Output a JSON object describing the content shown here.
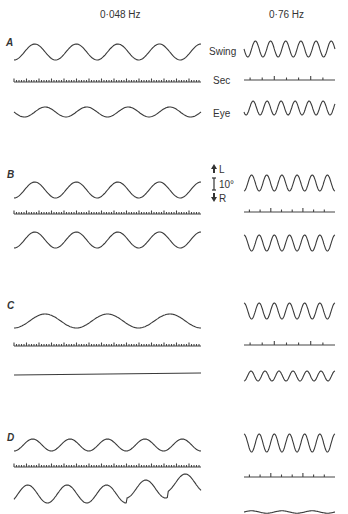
{
  "figure": {
    "column_titles": [
      "0·048 Hz",
      "0·76 Hz"
    ],
    "row_labels": [
      "Swing",
      "Sec",
      "Eye"
    ],
    "scale_bar": {
      "up": "L",
      "value": "10°",
      "down": "R"
    },
    "panels": [
      "A",
      "B",
      "C",
      "D"
    ]
  },
  "chart_data": {
    "type": "line",
    "columns": [
      {
        "frequency": "0·048 Hz"
      },
      {
        "frequency": "0·76 Hz"
      }
    ],
    "rows": [
      "Swing",
      "Sec",
      "Eye"
    ],
    "scale": {
      "label": "10°",
      "positive_direction": "L",
      "negative_direction": "R"
    },
    "panels": [
      {
        "label": "A",
        "0.048Hz": {
          "swing_cycles": 4.5,
          "swing_amp_px": 8,
          "sec_marks": "dense",
          "eye": "sinusoid",
          "eye_amp_px": 5,
          "eye_cycles": 4.5
        },
        "0.76Hz": {
          "swing_cycles": 6,
          "swing_amp_px": 8,
          "sec_marks": 7,
          "eye": "sinusoid",
          "eye_amp_px": 7,
          "eye_cycles": 6.5
        }
      },
      {
        "label": "B",
        "0.048Hz": {
          "swing_cycles": 4.5,
          "swing_amp_px": 8,
          "sec_marks": "dense",
          "eye": "sinusoid",
          "eye_amp_px": 8,
          "eye_cycles": 4.5
        },
        "0.76Hz": {
          "swing_cycles": 6,
          "swing_amp_px": 8,
          "sec_marks": 8,
          "eye": "sinusoid",
          "eye_amp_px": 8,
          "eye_cycles": 6
        }
      },
      {
        "label": "C",
        "0.048Hz": {
          "swing_cycles": 3,
          "swing_amp_px": 7,
          "sec_marks": "dense",
          "eye": "flat",
          "eye_amp_px": 0
        },
        "0.76Hz": {
          "swing_cycles": 6,
          "swing_amp_px": 8,
          "sec_marks": 7,
          "eye": "sinusoid",
          "eye_amp_px": 5,
          "eye_cycles": 6.5
        }
      },
      {
        "label": "D",
        "0.048Hz": {
          "swing_cycles": 5,
          "swing_amp_px": 6,
          "sec_marks": "dense",
          "eye": "sinusoid with saccadic resets",
          "eye_amp_px": 9,
          "eye_cycles": 5
        },
        "0.76Hz": {
          "swing_cycles": 6,
          "swing_amp_px": 9,
          "sec_marks": 8,
          "eye": "near-flat",
          "eye_amp_px": 1
        }
      }
    ]
  }
}
